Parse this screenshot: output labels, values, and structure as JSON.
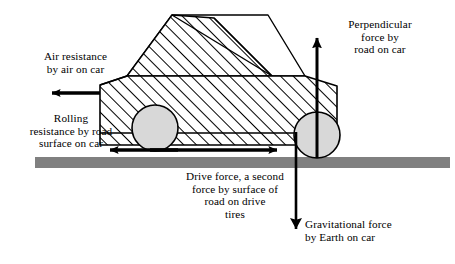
{
  "diagram": {
    "type": "physics-force-diagram",
    "labels": {
      "air_resistance": "Air resistance\nby air on car",
      "rolling_resistance": "Rolling\nresistance by road\nsurface on car",
      "drive_force": "Drive force, a second\nforce by surface of\nroad on drive\ntires",
      "perpendicular_force": "Perpendicular\nforce by\nroad on car",
      "gravitational_force": "Gravitational force\nby Earth on car"
    },
    "forces": [
      {
        "name": "air-resistance",
        "direction": "left",
        "tail": [
          100,
          93
        ],
        "head": [
          42,
          93
        ]
      },
      {
        "name": "rolling-resistance",
        "direction": "left",
        "tail": [
          178,
          150
        ],
        "head": [
          100,
          150
        ]
      },
      {
        "name": "drive-force",
        "direction": "right",
        "tail": [
          150,
          150
        ],
        "head": [
          287,
          150
        ]
      },
      {
        "name": "perpendicular-force",
        "direction": "up",
        "tail": [
          317,
          158
        ],
        "head": [
          317,
          27
        ]
      },
      {
        "name": "gravitational-force",
        "direction": "down",
        "tail": [
          296,
          132
        ],
        "head": [
          296,
          241
        ]
      }
    ],
    "colors": {
      "stroke": "#000000",
      "road": "#808080",
      "wheel_fill": "#d8d8d8",
      "body_fill": "#ffffff",
      "background": "#ffffff"
    },
    "objects": {
      "road": {
        "x": 35,
        "y": 157,
        "width": 415,
        "height": 11
      },
      "front_wheel": {
        "cx": 155,
        "cy": 128,
        "r": 23
      },
      "rear_wheel": {
        "cx": 317,
        "cy": 135,
        "r": 23
      },
      "car_body": "hatched",
      "windows": "unhatched"
    }
  }
}
